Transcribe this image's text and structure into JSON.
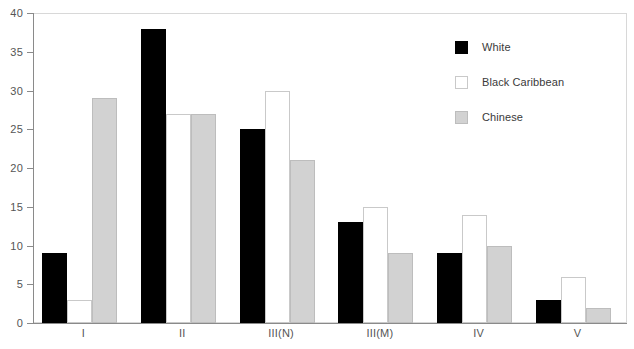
{
  "chart_data": {
    "type": "bar",
    "title": "",
    "subtitle": "",
    "xlabel": "",
    "ylabel": "",
    "categories": [
      "I",
      "II",
      "III(N)",
      "III(M)",
      "IV",
      "V"
    ],
    "series": [
      {
        "name": "White",
        "color": "#000000",
        "swatch": "filled-black",
        "values": [
          9,
          38,
          25,
          13,
          9,
          3
        ]
      },
      {
        "name": "Black Caribbean",
        "color": "#ffffff",
        "swatch": "outlined-white",
        "values": [
          3,
          27,
          30,
          15,
          14,
          6
        ]
      },
      {
        "name": "Chinese",
        "color": "#d2d2d2",
        "swatch": "filled-gray",
        "values": [
          29,
          27,
          21,
          9,
          10,
          2
        ]
      }
    ],
    "ylim": [
      0,
      40
    ],
    "yticks": [
      0,
      5,
      10,
      15,
      20,
      25,
      30,
      35,
      40
    ],
    "ytick_labels": [
      "0",
      "5",
      "10",
      "15",
      "20",
      "25",
      "30",
      "35",
      "40"
    ],
    "grid": false,
    "legend_position": "top-right",
    "annotations": []
  },
  "axes": {
    "y_axis_color": "#8a8a8a",
    "x_axis_color": "#8a8a8a",
    "tick_label_color": "#555555"
  },
  "legend": {
    "entries": [
      {
        "label": "White"
      },
      {
        "label": "Black Caribbean"
      },
      {
        "label": "Chinese"
      }
    ]
  }
}
